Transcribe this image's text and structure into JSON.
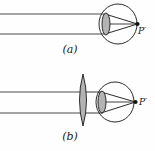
{
  "figure": {
    "background_color": "#fefefe",
    "stroke_color": "#2b2b2b",
    "lens_fill_color": "#b3b3b3",
    "ray_color": "#4a4a4a",
    "label_color": "#1a1a1a"
  },
  "panels": [
    {
      "id": "a",
      "caption": "(a)",
      "description": "Parallel rays entering the eye converge behind the retina",
      "focus_label": "P′",
      "eye": {
        "cx": 118,
        "cy": 24,
        "rx": 19,
        "ry": 20
      },
      "cornea": {
        "cx": 106,
        "cy": 24,
        "rx": 4,
        "ry": 11
      },
      "focus_point": {
        "x": 137,
        "y": 24
      },
      "incoming_rays": [
        {
          "y": 14,
          "x_start": 0,
          "x_end": 106
        },
        {
          "y": 34,
          "x_start": 0,
          "x_end": 106
        }
      ],
      "converging_rays": [
        {
          "x1": 106,
          "y1": 14,
          "x2": 137,
          "y2": 24
        },
        {
          "x1": 106,
          "y1": 34,
          "x2": 137,
          "y2": 24
        }
      ],
      "axis_ray": {
        "x1": 106,
        "y1": 24,
        "x2": 137,
        "y2": 24
      }
    },
    {
      "id": "b",
      "caption": "(b)",
      "description": "A converging corrective lens bends rays so they focus on the retina",
      "focus_label": "P′",
      "eye": {
        "cx": 115,
        "cy": 102,
        "rx": 19,
        "ry": 20
      },
      "cornea": {
        "cx": 102,
        "cy": 102,
        "rx": 4,
        "ry": 11
      },
      "corrective_lens": {
        "cx": 83,
        "cy": 100,
        "rx": 6,
        "ry": 26
      },
      "focus_point": {
        "x": 135,
        "y": 102
      },
      "incoming_rays": [
        {
          "y": 92,
          "x_start": 0,
          "x_end": 83
        },
        {
          "y": 113,
          "x_start": 0,
          "x_end": 83
        }
      ],
      "lens_to_cornea_rays": [
        {
          "x1": 83,
          "y1": 92,
          "x2": 102,
          "y2": 92
        },
        {
          "x1": 83,
          "y1": 113,
          "x2": 102,
          "y2": 113
        }
      ],
      "converging_rays": [
        {
          "x1": 102,
          "y1": 92,
          "x2": 135,
          "y2": 102
        },
        {
          "x1": 102,
          "y1": 113,
          "x2": 135,
          "y2": 102
        }
      ],
      "axis_ray": {
        "x1": 102,
        "y1": 102,
        "x2": 135,
        "y2": 102
      }
    }
  ]
}
